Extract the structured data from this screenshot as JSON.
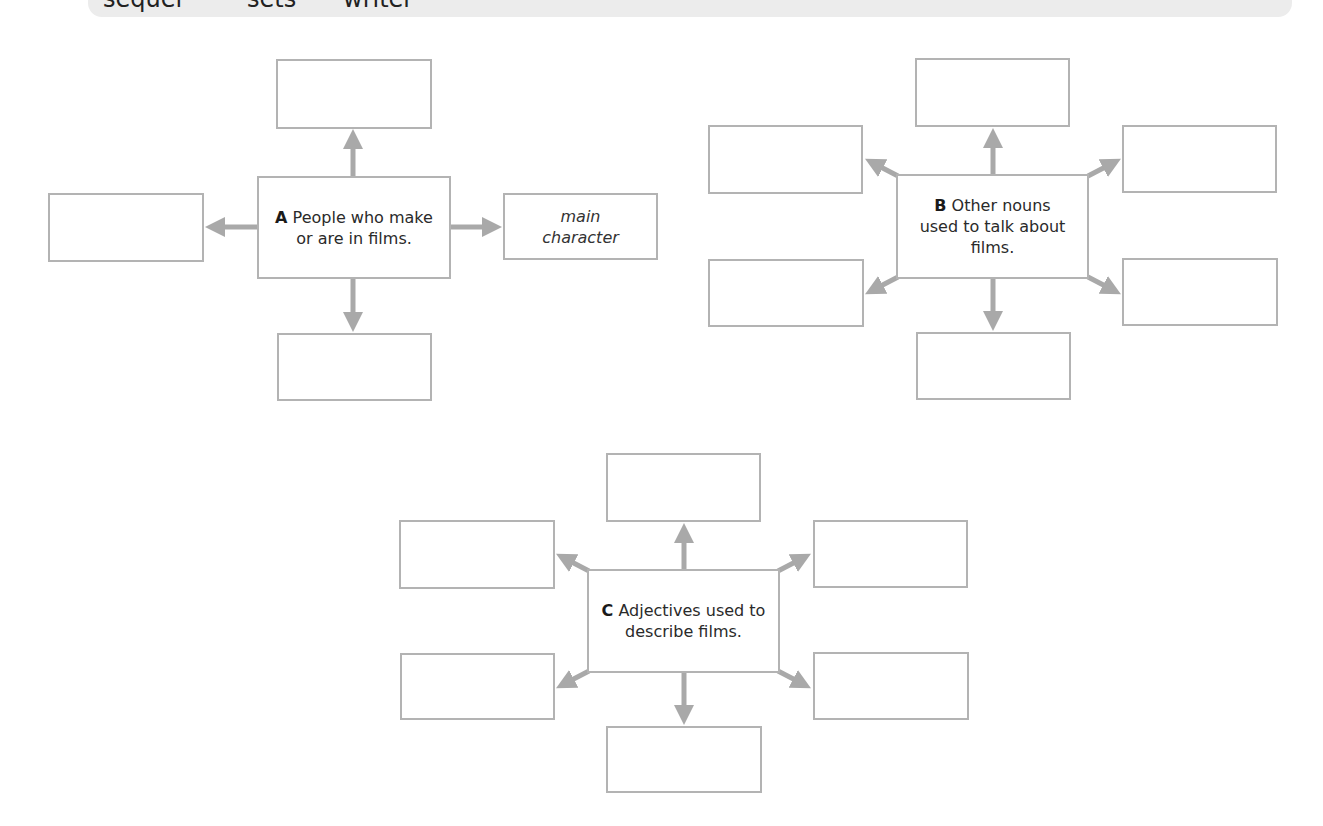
{
  "top_band": {
    "words": [
      "sequel",
      "sets",
      "writer"
    ]
  },
  "diagrams": {
    "A": {
      "letter": "A",
      "title": "People who make or are in films.",
      "boxes": {
        "top": "",
        "left": "",
        "right": "main character",
        "bottom": ""
      }
    },
    "B": {
      "letter": "B",
      "title": "Other nouns used to talk about films.",
      "boxes": {
        "top": "",
        "top_left": "",
        "top_right": "",
        "bottom_left": "",
        "bottom_right": "",
        "bottom": ""
      }
    },
    "C": {
      "letter": "C",
      "title": "Adjectives used to describe films.",
      "boxes": {
        "top": "",
        "top_left": "",
        "top_right": "",
        "bottom_left": "",
        "bottom_right": "",
        "bottom": ""
      }
    }
  },
  "colors": {
    "box_border": "#b3b3b3",
    "arrow": "#a9a9a9",
    "band": "#ececec",
    "text": "#222222"
  }
}
